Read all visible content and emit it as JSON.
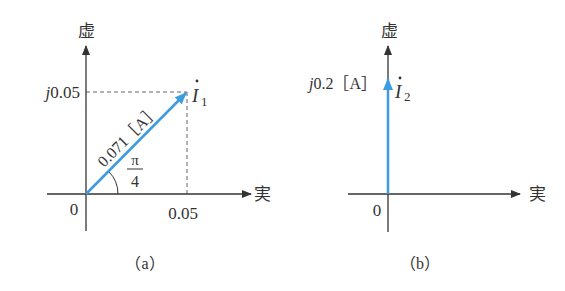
{
  "panels": [
    {
      "id": "a",
      "caption": "（a）",
      "axis_labels": {
        "imag": "虚",
        "real": "実"
      },
      "origin_label": "0",
      "imag_tick_label": "j0.05",
      "real_tick_label": "0.05",
      "phasor": {
        "name": "İ",
        "subscript": "1",
        "magnitude_label": "0.071［A］",
        "angle_label_num": "π",
        "angle_label_den": "4",
        "real": 0.05,
        "imag": 0.05,
        "magnitude": 0.071,
        "angle": "π/4"
      }
    },
    {
      "id": "b",
      "caption": "（b）",
      "axis_labels": {
        "imag": "虚",
        "real": "実"
      },
      "origin_label": "0",
      "phasor": {
        "name": "İ",
        "subscript": "2",
        "value_label": "j0.2［A］",
        "real": 0,
        "imag": 0.2
      }
    }
  ],
  "colors": {
    "axis": "#333333",
    "phasor": "#3d9be0",
    "dashed": "#666666"
  }
}
